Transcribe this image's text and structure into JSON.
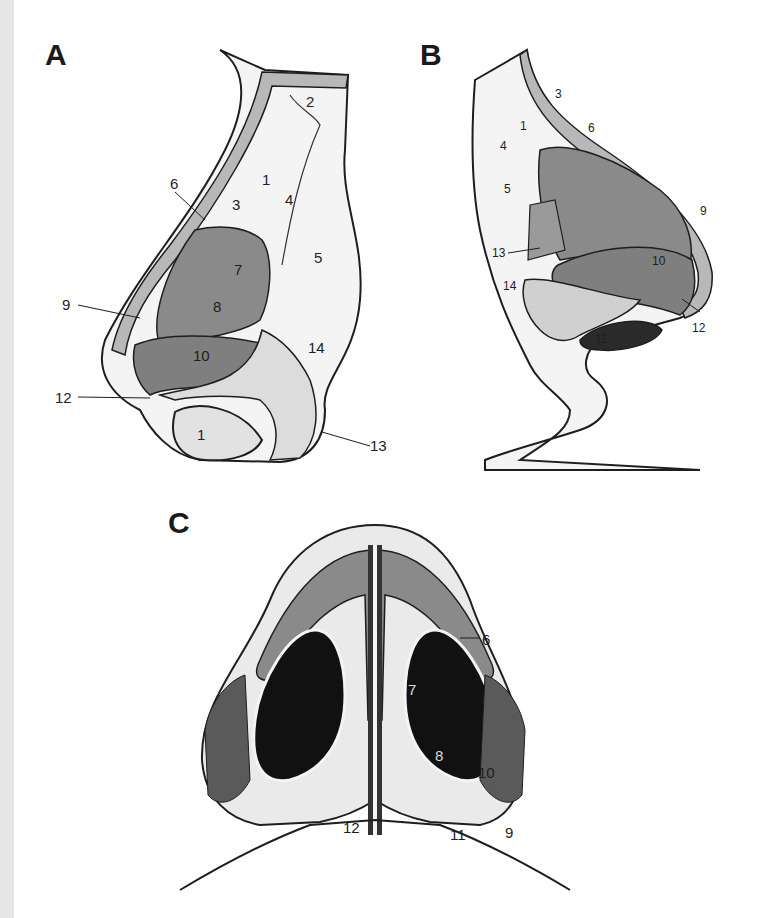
{
  "figure": {
    "panels": [
      {
        "id": "A",
        "letter": "A",
        "view": "lateral view of nose (sagittal cut-away)",
        "labels": [
          "1",
          "2",
          "3",
          "4",
          "5",
          "6",
          "7",
          "8",
          "9",
          "10",
          "12",
          "13",
          "14",
          "1"
        ]
      },
      {
        "id": "B",
        "letter": "B",
        "view": "oblique lateral view of nose",
        "labels": [
          "1",
          "3",
          "4",
          "5",
          "6",
          "9",
          "10",
          "11",
          "12",
          "13",
          "14"
        ]
      },
      {
        "id": "C",
        "letter": "C",
        "view": "basal (inferior) view of nose",
        "labels": [
          "6",
          "7",
          "8",
          "9",
          "10",
          "11",
          "12"
        ]
      }
    ]
  },
  "panelA": {
    "letter": "A",
    "l1": "1",
    "l2": "2",
    "l3": "3",
    "l4": "4",
    "l5": "5",
    "l6": "6",
    "l7": "7",
    "l8": "8",
    "l9": "9",
    "l10": "10",
    "l12": "12",
    "l13": "13",
    "l14": "14",
    "l1b": "1"
  },
  "panelB": {
    "letter": "B",
    "l1": "1",
    "l3": "3",
    "l4": "4",
    "l5": "5",
    "l6": "6",
    "l9": "9",
    "l10": "10",
    "l11": "11",
    "l12": "12",
    "l13": "13",
    "l14": "14"
  },
  "panelC": {
    "letter": "C",
    "l6": "6",
    "l7": "7",
    "l8": "8",
    "l9": "9",
    "l10": "10",
    "l11": "11",
    "l12": "12"
  },
  "colors": {
    "background": "#ffffff",
    "ink": "#1e1e1e",
    "muscle_gray": "#8a8a8a",
    "skin_fill": "#f4f4f4",
    "edge_strip": "#e6e6e6"
  }
}
